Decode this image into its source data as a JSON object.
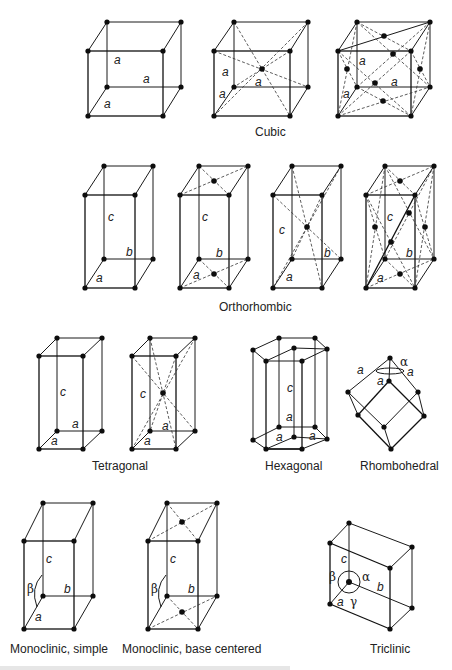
{
  "figure": {
    "labels": {
      "cubic": "Cubic",
      "orthorhombic": "Orthorhombic",
      "tetragonal": "Tetragonal",
      "hexagonal": "Hexagonal",
      "rhombohedral": "Rhombohedral",
      "monoclinic_simple": "Monoclinic, simple",
      "monoclinic_base": "Monoclinic, base centered",
      "triclinic": "Triclinic"
    },
    "params": {
      "a": "a",
      "b": "b",
      "c": "c",
      "alpha": "α",
      "beta": "β",
      "gamma": "γ"
    },
    "cells": [
      {
        "system": "Cubic",
        "type": "simple",
        "front": [
          88,
          51,
          163,
          116
        ],
        "offset": [
          19,
          -29
        ]
      },
      {
        "system": "Cubic",
        "type": "body-centered",
        "front": [
          214,
          51,
          290,
          116
        ],
        "offset": [
          19,
          -29
        ]
      },
      {
        "system": "Cubic",
        "type": "face-centered",
        "front": [
          338,
          51,
          411,
          116
        ],
        "offset": [
          19,
          -29
        ]
      },
      {
        "system": "Orthorhombic",
        "type": "simple",
        "front": [
          85,
          195,
          135,
          288
        ],
        "offset": [
          19,
          -29
        ]
      },
      {
        "system": "Orthorhombic",
        "type": "base-centered",
        "front": [
          180,
          195,
          229,
          288
        ],
        "offset": [
          19,
          -29
        ]
      },
      {
        "system": "Orthorhombic",
        "type": "body-centered",
        "front": [
          273,
          195,
          322,
          288
        ],
        "offset": [
          19,
          -29
        ]
      },
      {
        "system": "Orthorhombic",
        "type": "face-centered",
        "front": [
          366,
          195,
          415,
          288
        ],
        "offset": [
          19,
          -29
        ]
      },
      {
        "system": "Tetragonal",
        "type": "simple",
        "front": [
          39,
          356,
          83,
          449
        ],
        "offset": [
          18,
          -18
        ]
      },
      {
        "system": "Tetragonal",
        "type": "body-centered",
        "front": [
          132,
          356,
          176,
          449
        ],
        "offset": [
          18,
          -18
        ]
      },
      {
        "system": "Monoclinic",
        "type": "simple",
        "front": [
          24,
          541,
          74,
          629
        ],
        "offset": [
          19,
          -38
        ]
      },
      {
        "system": "Monoclinic",
        "type": "base-centered",
        "front": [
          148,
          541,
          198,
          629
        ],
        "offset": [
          19,
          -38
        ]
      }
    ]
  }
}
